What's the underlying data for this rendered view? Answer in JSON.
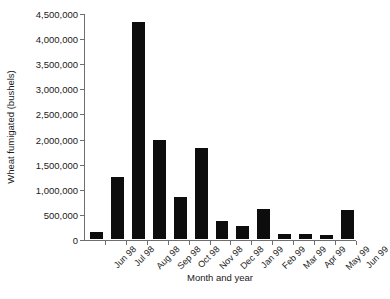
{
  "chart_data": {
    "type": "bar",
    "title": "",
    "subtitle": "",
    "xlabel": "Month and year",
    "ylabel": "Wheat fumigated (bushels)",
    "categories": [
      "Jun 98",
      "Jul 98",
      "Aug 98",
      "Sep 98",
      "Oct 98",
      "Nov 98",
      "Dec 98",
      "Jan 99",
      "Feb 99",
      "Mar 99",
      "Apr 99",
      "May 99",
      "Jun 99"
    ],
    "values": [
      140000,
      1230000,
      4330000,
      1970000,
      840000,
      1810000,
      360000,
      260000,
      600000,
      100000,
      100000,
      85000,
      580000
    ],
    "ylim": [
      0,
      4500000
    ],
    "ytick_values": [
      0,
      500000,
      1000000,
      1500000,
      2000000,
      2500000,
      3000000,
      3500000,
      4000000,
      4500000
    ],
    "ytick_labels": [
      "0",
      "500,000",
      "1,000,000",
      "1,500,000",
      "2,000,000",
      "2,500,000",
      "3,000,000",
      "3,500,000",
      "4,000,000",
      "4,500,000"
    ],
    "grid": false,
    "legend": null,
    "bar_color": "#0d0d0d",
    "axis_color": "#6e6e6e",
    "text_color": "#1a1a1a",
    "background": "#ffffff"
  }
}
